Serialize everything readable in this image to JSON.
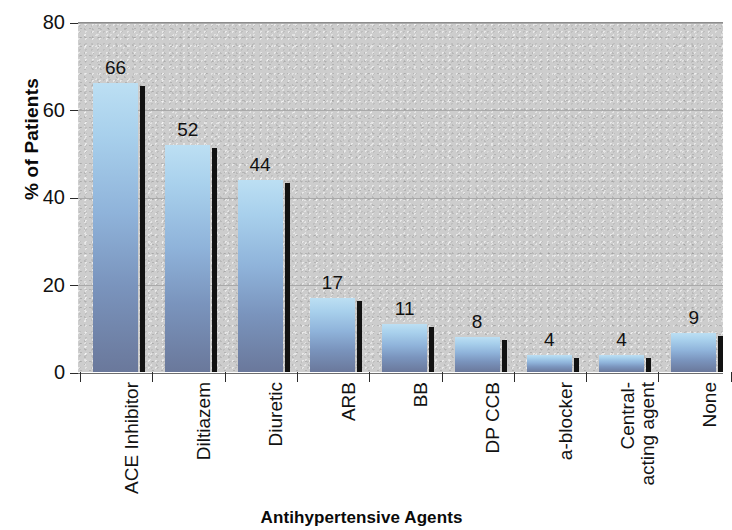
{
  "chart_data": {
    "type": "bar",
    "title": "",
    "xlabel": "Antihypertensive Agents",
    "ylabel": "% of Patients",
    "categories": [
      "ACE Inhibitor",
      "Diltiazem",
      "Diuretic",
      "ARB",
      "BB",
      "DP CCB",
      "a-blocker",
      "Central-\nacting agent",
      "None"
    ],
    "values": [
      66,
      52,
      44,
      17,
      11,
      8,
      4,
      4,
      9
    ],
    "value_labels": [
      "66",
      "52",
      "44",
      "17",
      "11",
      "8",
      "4",
      "4",
      "9"
    ],
    "ylim": [
      0,
      80
    ],
    "yticks": [
      0,
      20,
      40,
      60,
      80
    ],
    "ytick_labels": [
      "0",
      "20",
      "40",
      "60",
      "80"
    ],
    "grid": true,
    "grid_axis": "y",
    "legend": false,
    "legend_position": "none",
    "bar_color_top": "#bcdff3",
    "bar_color_bottom": "#6a789b",
    "bar_shadow_color": "#121212",
    "plot_background": "#cdcdcd",
    "figure_background": "#ffffff",
    "axis_text_color": "#111111"
  }
}
